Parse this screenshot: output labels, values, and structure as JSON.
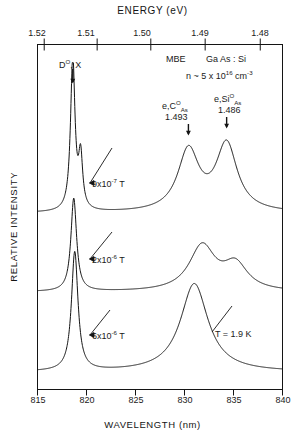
{
  "figure": {
    "top_axis": {
      "title": "ENERGY (eV)",
      "ticks": [
        "1.52",
        "1.51",
        "1.50",
        "1.49",
        "1.48"
      ],
      "tick_values": [
        1.52,
        1.51,
        1.5,
        1.49,
        1.48
      ]
    },
    "bottom_axis": {
      "title": "WAVELENGTH (nm)",
      "ticks": [
        "815",
        "820",
        "825",
        "830",
        "835",
        "840"
      ],
      "tick_values": [
        815,
        820,
        825,
        830,
        835,
        840
      ]
    },
    "y_axis": {
      "title": "RELATIVE INTENSITY"
    },
    "sample_info": {
      "growth": "MBE",
      "material": "Ga As : Si",
      "doping": "n ~ 5 x 10",
      "doping_exp": "16",
      "doping_unit": "cm",
      "doping_unit_exp": "-3",
      "temperature": "T = 1.9 K"
    },
    "peak_labels": {
      "bound_exciton": "D",
      "bound_exciton_sup": "O",
      "bound_exciton_rest": ", X",
      "carbon": "e,C",
      "carbon_sup": "O",
      "carbon_sub": "As",
      "carbon_energy": "1.493",
      "silicon": "e,Si",
      "silicon_sup": "O",
      "silicon_sub": "As",
      "silicon_energy": "1.486"
    },
    "curve_labels": [
      {
        "mantissa": "9x10",
        "exponent": "-7",
        "unit": "T"
      },
      {
        "mantissa": "2x10",
        "exponent": "-6",
        "unit": "T"
      },
      {
        "mantissa": "6x10",
        "exponent": "-6",
        "unit": "T"
      }
    ],
    "colors": {
      "line": "#141414",
      "background": "#ffffff",
      "text": "#141414"
    }
  },
  "chart_data": {
    "type": "line",
    "xlabel": "WAVELENGTH (nm)",
    "ylabel": "RELATIVE INTENSITY",
    "xlabel_top": "ENERGY (eV)",
    "xlim": [
      815,
      840
    ],
    "xlim_top": [
      1.5225,
      1.4766
    ],
    "grid": false,
    "legend": "inline-curve-labels",
    "xticks": [
      815,
      820,
      825,
      830,
      835,
      840
    ],
    "xticks_top": [
      1.52,
      1.51,
      1.5,
      1.49,
      1.48
    ],
    "annotations": [
      {
        "text": "D0, X",
        "x_nm": 818.6,
        "energy_eV": 1.5148,
        "kind": "arrow-down"
      },
      {
        "text": "e,C0As 1.493",
        "x_nm": 830.4,
        "energy_eV": 1.493,
        "kind": "arrow-down"
      },
      {
        "text": "e,Si0As 1.486",
        "x_nm": 834.3,
        "energy_eV": 1.486,
        "kind": "arrow-down"
      },
      {
        "text": "MBE  Ga As : Si",
        "kind": "text"
      },
      {
        "text": "n ~ 5 x 10^16 cm^-3",
        "kind": "text"
      },
      {
        "text": "T = 1.9 K",
        "kind": "text"
      }
    ],
    "series": [
      {
        "name": "9x10-7 T",
        "label": "9x10^-7 T",
        "comment": "top trace: sharp intense D0,X doublet near 818.6 nm, plus resolved e,C0As (830.4) and e,Si0As (834.3) peaks",
        "peaks": [
          {
            "x_nm": 818.6,
            "relative_height": 1.0,
            "fwhm_nm": 0.55
          },
          {
            "x_nm": 819.4,
            "relative_height": 0.34,
            "fwhm_nm": 0.5
          },
          {
            "x_nm": 830.4,
            "relative_height": 0.4,
            "fwhm_nm": 2.6
          },
          {
            "x_nm": 834.3,
            "relative_height": 0.44,
            "fwhm_nm": 2.6
          }
        ]
      },
      {
        "name": "2x10-6 T",
        "label": "2x10^-6 T",
        "comment": "middle trace: D0,X still sharp, donor-acceptor band broadened into single peak near 832 nm with shoulder at 835",
        "peaks": [
          {
            "x_nm": 818.7,
            "relative_height": 0.62,
            "fwhm_nm": 0.7
          },
          {
            "x_nm": 831.8,
            "relative_height": 0.3,
            "fwhm_nm": 3.2
          },
          {
            "x_nm": 835.2,
            "relative_height": 0.17,
            "fwhm_nm": 3.0
          }
        ]
      },
      {
        "name": "6x10-6 T",
        "label": "6x10^-6 T",
        "comment": "bottom trace: sharp D0,X peak and one broad merged band centered near 831 nm",
        "peaks": [
          {
            "x_nm": 818.8,
            "relative_height": 0.7,
            "fwhm_nm": 0.8
          },
          {
            "x_nm": 831.0,
            "relative_height": 0.52,
            "fwhm_nm": 3.4
          }
        ]
      }
    ]
  }
}
